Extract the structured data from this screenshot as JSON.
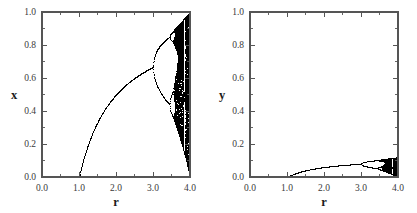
{
  "figure": {
    "background": "#ffffff",
    "ink_color": "#000000",
    "axis_color": "#555555",
    "width": 417,
    "height": 213
  },
  "chart_data": [
    {
      "type": "scatter",
      "title": "",
      "panel": "left",
      "xlabel": "r",
      "ylabel": "x",
      "xlim": [
        0.0,
        4.0
      ],
      "ylim": [
        0.0,
        1.0
      ],
      "xticks": [
        0.0,
        1.0,
        2.0,
        3.0,
        4.0
      ],
      "xticklabels": [
        "0.0",
        "1.0",
        "2.0",
        "3.0",
        "4.0"
      ],
      "yticks": [
        0.0,
        0.2,
        0.4,
        0.6,
        0.8,
        1.0
      ],
      "yticklabels": [
        "0.0",
        "0.2",
        "0.4",
        "0.6",
        "0.8",
        "1.0"
      ],
      "xminor_step": 0.5,
      "yminor_step": 0.1,
      "grid": false,
      "legend": false,
      "marker": "pixel-dot",
      "description": "Logistic map bifurcation diagram: attractor of x_{n+1} = r*x_n*(1-x_n) plotted against r.",
      "model": "logistic",
      "map_scale": 1.0,
      "r_start": 0.0,
      "r_end": 4.0,
      "r_samples": 560,
      "transient_iterations": 300,
      "plotted_iterations": 160,
      "x0": 0.35,
      "features": {
        "fixed_point_zero_until_r": 1.0,
        "first_bifurcation_r": 3.0,
        "second_bifurcation_r": 3.449,
        "third_bifurcation_r": 3.544,
        "chaos_onset_r": 3.5699,
        "value_at_r3": 0.667,
        "max_value_at_r4": 1.0,
        "period3_window_r": 3.8284
      }
    },
    {
      "type": "scatter",
      "title": "",
      "panel": "right",
      "xlabel": "r",
      "ylabel": "y",
      "xlim": [
        0.0,
        4.0
      ],
      "ylim": [
        0.0,
        1.0
      ],
      "xticks": [
        0.0,
        1.0,
        2.0,
        3.0,
        4.0
      ],
      "xticklabels": [
        "0.0",
        "1.0",
        "2.0",
        "3.0",
        "4.0"
      ],
      "yticks": [
        0.0,
        0.2,
        0.4,
        0.6,
        0.8,
        1.0
      ],
      "yticklabels": [
        "0.0",
        "0.2",
        "0.4",
        "0.6",
        "0.8",
        "1.0"
      ],
      "xminor_step": 0.5,
      "yminor_step": 0.1,
      "grid": false,
      "legend": false,
      "marker": "pixel-dot",
      "description": "Companion bifurcation diagram for variable y, vertically compressed: same logistic cascade scaled to roughly one eighth of the full range.",
      "model": "logistic",
      "map_scale": 0.12,
      "r_start": 0.0,
      "r_end": 4.0,
      "r_samples": 560,
      "transient_iterations": 300,
      "plotted_iterations": 160,
      "x0": 0.35,
      "features": {
        "fixed_point_zero_until_r": 1.0,
        "first_bifurcation_r": 3.0,
        "second_bifurcation_r": 3.449,
        "third_bifurcation_r": 3.544,
        "chaos_onset_r": 3.5699,
        "value_at_r3": 0.08,
        "max_value_at_r4": 0.12,
        "period3_window_r": 3.8284
      }
    }
  ]
}
